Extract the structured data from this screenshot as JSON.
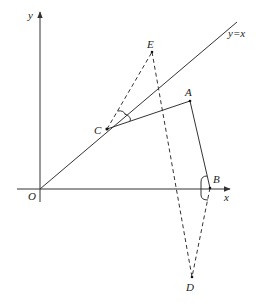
{
  "diagram": {
    "type": "coordinate-geometry",
    "axes": {
      "x_label": "x",
      "y_label": "y",
      "origin_label": "O"
    },
    "line": {
      "label": "y=x",
      "style": "solid"
    },
    "points": [
      {
        "name": "A",
        "label": "A"
      },
      {
        "name": "B",
        "label": "B"
      },
      {
        "name": "C",
        "label": "C"
      },
      {
        "name": "D",
        "label": "D"
      },
      {
        "name": "E",
        "label": "E"
      },
      {
        "name": "O",
        "label": "O"
      }
    ],
    "segments": [
      {
        "from": "C",
        "to": "A",
        "style": "solid"
      },
      {
        "from": "A",
        "to": "B",
        "style": "solid"
      },
      {
        "from": "C",
        "to": "E",
        "style": "dashed"
      },
      {
        "from": "E",
        "to": "D",
        "style": "dashed"
      },
      {
        "from": "B",
        "to": "D",
        "style": "dashed"
      }
    ],
    "angle_marks": [
      {
        "vertex": "C",
        "between": [
          "CE",
          "y=x"
        ]
      },
      {
        "vertex": "C",
        "between": [
          "y=x",
          "CA"
        ]
      },
      {
        "vertex": "B",
        "between": [
          "BA",
          "x-axis"
        ]
      },
      {
        "vertex": "B",
        "between": [
          "x-axis",
          "BD"
        ]
      }
    ],
    "colors": {
      "stroke": "#333333",
      "text": "#222222",
      "background": "#ffffff"
    }
  }
}
